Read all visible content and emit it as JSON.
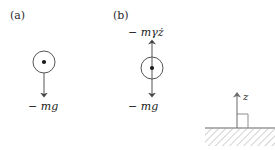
{
  "figure": {
    "background_color": "#ffffff",
    "stroke_color": "#444444",
    "text_color": "#222222",
    "ground_hatch_color": "#bfbfbf"
  },
  "panels": [
    {
      "id": "a",
      "label": "(a)",
      "body": {
        "shape": "circle-with-center-dot",
        "center_x": 44,
        "center_y": 62,
        "radius": 11
      },
      "forces": [
        {
          "name": "weight",
          "label": "− mg",
          "direction": "down",
          "from_y": 62,
          "to_y": 98
        }
      ]
    },
    {
      "id": "b",
      "label": "(b)",
      "body": {
        "shape": "circle-with-center-dot",
        "center_x": 152,
        "center_y": 68,
        "radius": 11
      },
      "forces": [
        {
          "name": "drag",
          "label": "− mγż",
          "direction": "up",
          "from_y": 68,
          "to_y": 41
        },
        {
          "name": "weight",
          "label": "− mg",
          "direction": "down",
          "from_y": 68,
          "to_y": 98
        }
      ]
    }
  ],
  "axis_reference": {
    "axis_label": "z",
    "direction": "up",
    "arrow_x": 237,
    "arrow_top_y": 93,
    "arrow_bottom_y": 128,
    "ground_line_y": 128,
    "ground_left_x": 205,
    "ground_right_x": 275,
    "right_angle_marker": true
  }
}
